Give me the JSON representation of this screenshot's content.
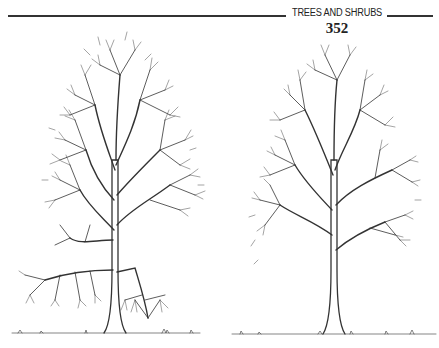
{
  "header": {
    "running_head": "TREES AND SHRUBS",
    "page_number": "352"
  },
  "illustrations": [
    {
      "subject": "deciduous tree silhouette, bare branches (left)"
    },
    {
      "subject": "deciduous tree silhouette, bare branches (right)"
    }
  ],
  "colors": {
    "ink": "#333333",
    "paper": "#ffffff"
  }
}
